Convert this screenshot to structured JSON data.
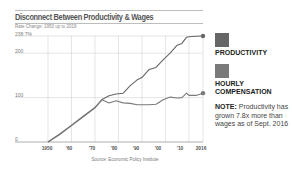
{
  "chart_data": {
    "type": "line",
    "title": "Disconnect Between Productivity & Wages",
    "subtitle": "Rate Change: 1950 up to 2016",
    "xlabel": "",
    "ylabel": "",
    "x_ticks": [
      "1950",
      "'60",
      "'70",
      "'80",
      "'90",
      "'00",
      "'10",
      "2016"
    ],
    "y_ticks": [
      "0",
      "100",
      "200",
      "238.7%"
    ],
    "ylim": [
      0,
      238.7
    ],
    "xlim": [
      1950,
      2016
    ],
    "grid": true,
    "legend_position": "right",
    "x": [
      1950,
      1955,
      1960,
      1965,
      1970,
      1973,
      1976,
      1979,
      1982,
      1985,
      1988,
      1990,
      1993,
      1996,
      1999,
      2002,
      2005,
      2007,
      2009,
      2010,
      2013,
      2016
    ],
    "series": [
      {
        "name": "Productivity",
        "color": "#666666",
        "values": [
          0,
          17,
          37,
          57,
          77,
          96,
          104,
          108,
          110,
          127,
          140,
          145,
          163,
          168,
          185,
          200,
          218,
          222,
          236,
          237,
          238,
          238.7
        ]
      },
      {
        "name": "Hourly Compensation",
        "color": "#7a7a7a",
        "values": [
          0,
          18,
          38,
          58,
          78,
          95,
          88,
          93,
          88,
          87,
          84,
          84,
          84,
          85,
          95,
          101,
          99,
          100,
          110,
          105,
          105,
          110
        ]
      }
    ],
    "annotations": [
      "NOTE: Productivity has grown 7.8x more than wages as of Sept. 2016"
    ],
    "source": "Source: Economic Policy Institute"
  },
  "header": {
    "title": "Disconnect Between Productivity & Wages",
    "subtitle": "Rate Change: 1950 up to 2016"
  },
  "axis": {
    "y_top": "238.7%",
    "y_labels": [
      "200",
      "100",
      "0"
    ],
    "x_labels": [
      "1950",
      "'60",
      "'70",
      "'80",
      "'90",
      "'00",
      "'10",
      "2016"
    ]
  },
  "legend": {
    "items": [
      {
        "label": "PRODUCTIVITY",
        "color": "#666666"
      },
      {
        "label": "HOURLY COMPENSATION",
        "color": "#7a7a7a"
      }
    ],
    "note_label": "NOTE:",
    "note_text": " Productivity has grown 7.8x more than wages as of Sept. 2016"
  },
  "footer": {
    "source": "Source: Economic Policy Institute"
  }
}
